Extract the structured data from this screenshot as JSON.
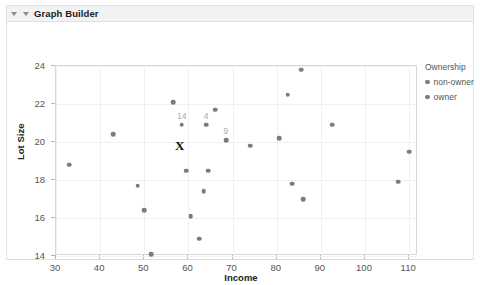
{
  "window": {
    "panel_title": "Graph Builder",
    "disclosure_icon": "triangle-down-icon",
    "disclosure_icon_2": "triangle-down-icon"
  },
  "legend": {
    "title": "Ownership",
    "items": [
      {
        "label": "non-owner",
        "color": "#7b7b7b"
      },
      {
        "label": "owner",
        "color": "#7b7b7b"
      }
    ]
  },
  "annotations": {
    "x_marker": "X"
  },
  "caption": "",
  "chart_data": {
    "type": "scatter",
    "title": "",
    "xlabel": "Income",
    "ylabel": "Lot Size",
    "xlim": [
      30,
      112
    ],
    "ylim": [
      14,
      24
    ],
    "xticks": [
      30,
      40,
      50,
      60,
      70,
      80,
      90,
      100,
      110
    ],
    "yticks": [
      14,
      16,
      18,
      20,
      22,
      24
    ],
    "grid": true,
    "legend_position": "right",
    "point_color": "#7b7b7b",
    "series": [
      {
        "name": "Ownership",
        "points": [
          {
            "x": 33.0,
            "y": 18.8,
            "label": ""
          },
          {
            "x": 43.0,
            "y": 20.4,
            "label": ""
          },
          {
            "x": 48.5,
            "y": 17.7,
            "label": ""
          },
          {
            "x": 50.0,
            "y": 16.4,
            "label": ""
          },
          {
            "x": 51.5,
            "y": 14.1,
            "label": ""
          },
          {
            "x": 56.5,
            "y": 22.1,
            "label": ""
          },
          {
            "x": 58.5,
            "y": 20.9,
            "label": "14"
          },
          {
            "x": 59.5,
            "y": 18.5,
            "label": ""
          },
          {
            "x": 60.5,
            "y": 16.1,
            "label": ""
          },
          {
            "x": 62.5,
            "y": 14.9,
            "label": ""
          },
          {
            "x": 63.5,
            "y": 17.4,
            "label": ""
          },
          {
            "x": 64.0,
            "y": 20.9,
            "label": "4"
          },
          {
            "x": 64.5,
            "y": 18.5,
            "label": ""
          },
          {
            "x": 66.0,
            "y": 21.7,
            "label": ""
          },
          {
            "x": 68.5,
            "y": 20.1,
            "label": "9"
          },
          {
            "x": 74.0,
            "y": 19.8,
            "label": ""
          },
          {
            "x": 80.5,
            "y": 20.2,
            "label": ""
          },
          {
            "x": 82.5,
            "y": 22.5,
            "label": ""
          },
          {
            "x": 83.5,
            "y": 17.8,
            "label": ""
          },
          {
            "x": 85.5,
            "y": 23.8,
            "label": ""
          },
          {
            "x": 86.0,
            "y": 17.0,
            "label": ""
          },
          {
            "x": 92.5,
            "y": 20.9,
            "label": ""
          },
          {
            "x": 107.5,
            "y": 17.9,
            "label": ""
          },
          {
            "x": 110.0,
            "y": 19.5,
            "label": ""
          }
        ]
      }
    ],
    "marker_annotation": {
      "x": 58.0,
      "y": 19.8,
      "text": "X"
    }
  }
}
